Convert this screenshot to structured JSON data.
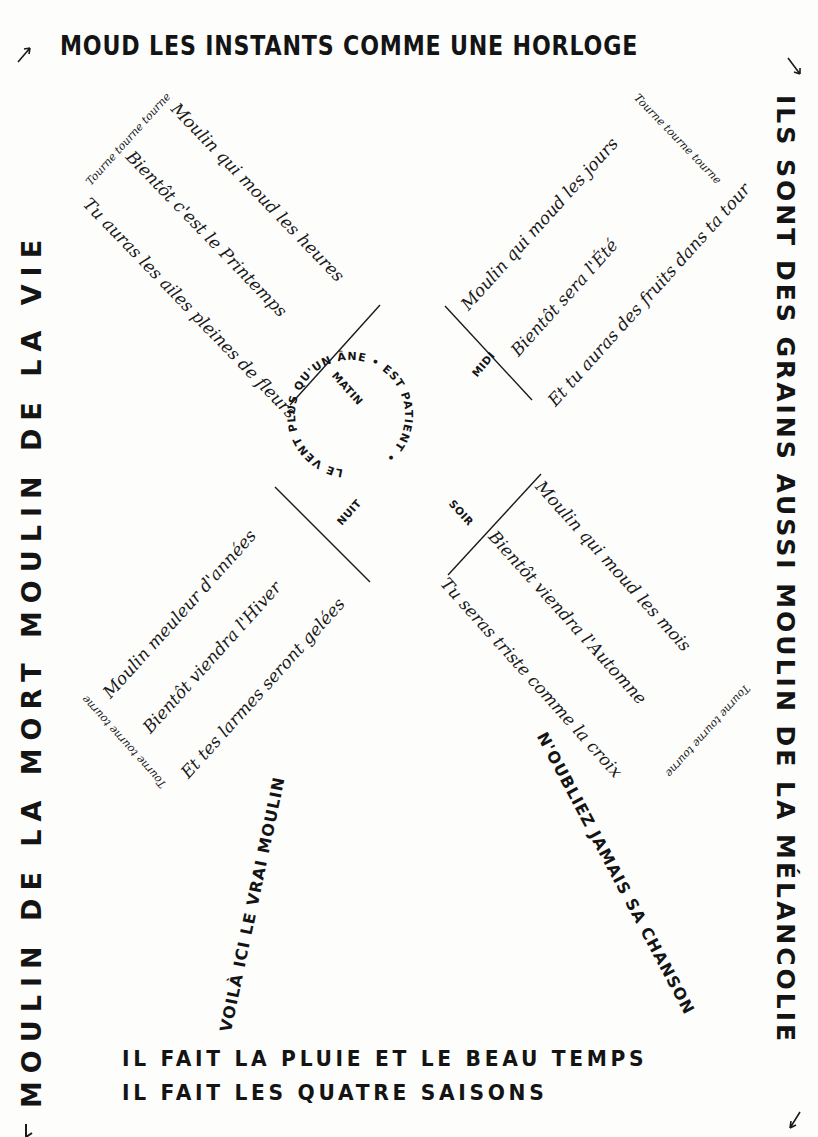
{
  "poem": {
    "top": "MOUD LES INSTANTS COMME UNE HORLOGE",
    "right": "ILS SONT DES GRAINS AUSSI MOULIN DE LA MÉLANCOLIE",
    "left": "MOULIN DE LA MORT MOULIN DE LA VIE",
    "bottom": [
      "IL FAIT  LA PLUIE ET LE BEAU TEMPS",
      "IL FAIT  LES  QUATRE  SAISONS"
    ],
    "stem_left": "VOILÀ ICI LE VRAI MOULIN",
    "stem_right": "N'OUBLIEZ JAMAIS SA CHANSON",
    "hub": {
      "circle": "LE VENT PLUS QU'UN ÂNE • EST PATIENT •",
      "matin": "MATIN",
      "midi": "MIDI",
      "soir": "SOIR",
      "nuit": "NUIT"
    },
    "wings": {
      "top_left": {
        "refrain": "Tourne tourne tourne",
        "lines": [
          "Moulin qui moud les heures",
          "Bientôt c'est le Printemps",
          "Tu auras les ailes pleines de fleurs"
        ]
      },
      "top_right": {
        "refrain": "Tourne tourne tourne",
        "lines": [
          "Moulin qui moud les jours",
          "Bientôt sera l'Été",
          "Et tu auras des fruits dans ta tour"
        ]
      },
      "bottom_left": {
        "refrain": "Tourne tourne tourne",
        "lines": [
          "Moulin meuleur d'années",
          "Bientôt viendra l'Hiver",
          "Et tes larmes seront gelées"
        ]
      },
      "bottom_right": {
        "refrain": "Tourne tourne tourne",
        "lines": [
          "Moulin qui moud les mois",
          "Bientôt viendra l'Automne",
          "Tu seras triste comme la croix"
        ]
      }
    },
    "colors": {
      "ink": "#141414",
      "paper": "#fdfdfc"
    }
  }
}
